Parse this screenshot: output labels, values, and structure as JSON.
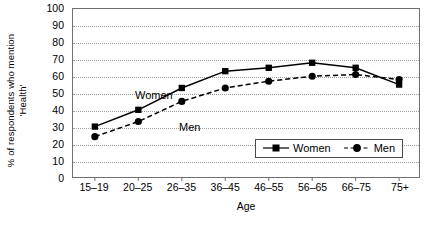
{
  "chart_data": {
    "type": "line",
    "title": "",
    "subtitle": "",
    "xlabel": "Age",
    "ylabel": "% of respondents who mention 'Health'",
    "ylabel_line1": "% of respondents who mention",
    "ylabel_line2": "'Health'",
    "categories": [
      "15–19",
      "20–25",
      "26–35",
      "36–45",
      "46–55",
      "56–65",
      "66–75",
      "75+"
    ],
    "ylim": [
      0,
      100
    ],
    "ytick_values": [
      0,
      10,
      20,
      30,
      40,
      50,
      60,
      70,
      80,
      90,
      100
    ],
    "ytick_labels": [
      "0",
      "10",
      "20",
      "30",
      "40",
      "50",
      "60",
      "70",
      "80",
      "90",
      "100"
    ],
    "grid": "horizontal-dotted",
    "legend_position": "inside-bottom-right",
    "series": [
      {
        "name": "Women",
        "values": [
          30,
          40,
          53,
          63,
          65,
          68,
          65,
          55
        ],
        "line_style": "solid",
        "marker": "square",
        "color": "#000000"
      },
      {
        "name": "Men",
        "values": [
          24,
          33,
          45,
          53,
          57,
          60,
          61,
          58
        ],
        "line_style": "dashed",
        "marker": "circle",
        "color": "#000000"
      }
    ],
    "annotations": [
      {
        "text": "Women",
        "series": "Women"
      },
      {
        "text": "Men",
        "series": "Men"
      }
    ]
  },
  "legend": {
    "entries": [
      {
        "label": "Women"
      },
      {
        "label": "Men"
      }
    ]
  },
  "colors": {
    "ink": "#000000",
    "axis": "#6f6f6f",
    "grid": "#9a9a9a",
    "background": "#ffffff"
  }
}
